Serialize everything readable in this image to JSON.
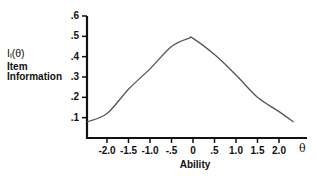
{
  "chart_data": {
    "type": "line",
    "title": "",
    "ylabel_symbol": "I",
    "ylabel_subscript": "i",
    "ylabel_arg": "(θ)",
    "ylabel_line2": "Item",
    "ylabel_line3": "Information",
    "xlabel": "Ability",
    "x_symbol": "θ",
    "ylim": [
      0,
      0.6
    ],
    "xlim": [
      -2.5,
      2.65
    ],
    "grid": false,
    "legend": "none",
    "y_ticks": [
      {
        "value": 0.1,
        "label": ".1"
      },
      {
        "value": 0.2,
        "label": ".2"
      },
      {
        "value": 0.3,
        "label": ".3"
      },
      {
        "value": 0.4,
        "label": ".4"
      },
      {
        "value": 0.5,
        "label": ".5"
      },
      {
        "value": 0.6,
        "label": ".6"
      }
    ],
    "x_ticks": [
      {
        "value": -2.0,
        "label": "-2.0"
      },
      {
        "value": -1.5,
        "label": "-1.5"
      },
      {
        "value": -1.0,
        "label": "-1.0"
      },
      {
        "value": -0.5,
        "label": "-.5"
      },
      {
        "value": 0.0,
        "label": "0"
      },
      {
        "value": 0.5,
        "label": ".5"
      },
      {
        "value": 1.0,
        "label": "1.0"
      },
      {
        "value": 1.5,
        "label": "1.5"
      },
      {
        "value": 2.0,
        "label": "2.0"
      }
    ],
    "series": [
      {
        "name": "Item Information",
        "x": [
          -2.45,
          -2.0,
          -1.5,
          -1.0,
          -0.5,
          -0.1,
          0.0,
          0.5,
          1.0,
          1.5,
          2.0,
          2.33
        ],
        "values": [
          0.08,
          0.12,
          0.24,
          0.34,
          0.45,
          0.49,
          0.49,
          0.41,
          0.31,
          0.2,
          0.13,
          0.08
        ]
      }
    ]
  },
  "colors": {
    "axis": "#111111",
    "curve": "#555555",
    "background": "#ffffff"
  }
}
